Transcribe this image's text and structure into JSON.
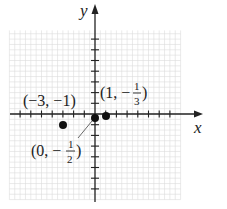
{
  "diagram": {
    "type": "coordinate-plane",
    "axes": {
      "x_label": "x",
      "y_label": "y",
      "x_range": [
        -8,
        8
      ],
      "y_range": [
        -8,
        8
      ],
      "tick_interval": 1,
      "grid_minor_interval": 0.5
    },
    "points": [
      {
        "x": -3,
        "y": -1,
        "label_open": "(−3, −1)"
      },
      {
        "x": 0,
        "y": -0.5,
        "label_prefix": "(0, −",
        "frac_num": "1",
        "frac_den": "2",
        "label_suffix": ")"
      },
      {
        "x": 1,
        "y": -0.333,
        "label_prefix": "(1, −",
        "frac_num": "1",
        "frac_den": "3",
        "label_suffix": ")"
      }
    ],
    "colors": {
      "grid": "#d8d8d8",
      "axis": "#222222",
      "point": "#111111"
    }
  }
}
